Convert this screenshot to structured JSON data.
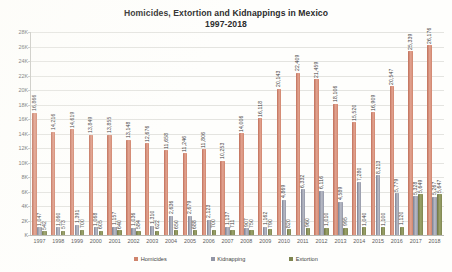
{
  "chart_data": {
    "type": "bar",
    "title": "Homicides, Extortion and Kidnappings in Mexico",
    "subtitle": "1997-2018",
    "xlabel": "",
    "ylabel": "",
    "ylim": [
      0,
      28000
    ],
    "ytick_labels": [
      "28K",
      "26K",
      "24K",
      "22K",
      "20K",
      "18K",
      "16K",
      "14K",
      "12K",
      "10K",
      "8K",
      "6K",
      "4K",
      "2K",
      "K"
    ],
    "ytick_values": [
      28000,
      26000,
      24000,
      22000,
      20000,
      18000,
      16000,
      14000,
      12000,
      10000,
      8000,
      6000,
      4000,
      2000,
      0
    ],
    "grid": true,
    "legend_position": "bottom",
    "categories": [
      "1997",
      "1998",
      "1999",
      "2000",
      "2001",
      "2002",
      "2003",
      "2004",
      "2005",
      "2006",
      "2007",
      "2008",
      "2009",
      "2010",
      "2011",
      "2012",
      "2013",
      "2014",
      "2015",
      "2016",
      "2017",
      "2018"
    ],
    "series": [
      {
        "name": "Homicides",
        "color": "#cf846c",
        "values": [
          16866,
          14216,
          14619,
          13849,
          13855,
          13148,
          12676,
          11658,
          11246,
          11806,
          10253,
          14006,
          16118,
          20143,
          22409,
          21459,
          18106,
          15520,
          16909,
          20547,
          25339,
          26176
        ],
        "labels": [
          "16,866",
          "14,216",
          "14,619",
          "13,849",
          "13,855",
          "13,148",
          "12,676",
          "11,658",
          "11,246",
          "11,806",
          "10,253",
          "14,006",
          "16,118",
          "20,143",
          "22,409",
          "21,459",
          "18,106",
          "15,520",
          "16,909",
          "20,547",
          "25,339",
          "26,176"
        ]
      },
      {
        "name": "Kidnapping",
        "color": "#9296a6",
        "values": [
          1047,
          1060,
          1391,
          1068,
          1157,
          1036,
          1310,
          2636,
          2679,
          2123,
          1137,
          907,
          1162,
          4869,
          6332,
          6116,
          4589,
          7280,
          8213,
          5779,
          5328,
          5267
        ],
        "labels": [
          "1,047",
          "1,060",
          "1,391",
          "1,068",
          "1,157",
          "1,036",
          "1,310",
          "2,636",
          "2,679",
          "2,123",
          "1,137",
          "907",
          "1,162",
          "4,869",
          "6,332",
          "6,116",
          "4,589",
          "7,280",
          "8,213",
          "5,779",
          "5,328",
          "5,267"
        ]
      },
      {
        "name": "Extortion",
        "color": "#7e8550",
        "values": [
          542,
          573,
          700,
          605,
          640,
          584,
          622,
          650,
          688,
          700,
          711,
          750,
          790,
          820,
          960,
          1010,
          995,
          1040,
          1100,
          1120,
          5649,
          5647
        ],
        "labels": [
          "542",
          "573",
          "700",
          "605",
          "640",
          "584",
          "622",
          "650",
          "688",
          "700",
          "711",
          "750",
          "790",
          "820",
          "960",
          "1,010",
          "995",
          "1,040",
          "1,100",
          "1,120",
          "5,649",
          "5,647"
        ]
      }
    ]
  },
  "legend": {
    "items": [
      {
        "label": "Homicides",
        "color": "#cf846c"
      },
      {
        "label": "Kidnapping",
        "color": "#9296a6"
      },
      {
        "label": "Extortion",
        "color": "#7e8550"
      }
    ]
  }
}
